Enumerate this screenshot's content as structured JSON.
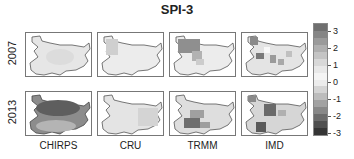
{
  "chart_data": {
    "type": "heatmap",
    "title": "SPI-3",
    "rows": [
      "2007",
      "2013"
    ],
    "columns": [
      "CHIRPS",
      "CRU",
      "TRMM",
      "IMD"
    ],
    "colorbar": {
      "ticks": [
        3,
        2,
        1,
        0,
        -1,
        -2,
        -3
      ],
      "range": [
        -3.3,
        3.3
      ],
      "colors_high_to_low": [
        "#6f6f6f",
        "#858585",
        "#9a9a9a",
        "#afafaf",
        "#c4c4c4",
        "#d8d8d8",
        "#e8e8e8",
        "#f4f4f4",
        "#ececec",
        "#d4d4d4",
        "#bcbcbc",
        "#a2a2a2",
        "#888888",
        "#6c6c6c",
        "#4f4f4f",
        "#353535"
      ]
    },
    "panels": [
      {
        "row": "2007",
        "col": "CHIRPS",
        "description": "uniformly near 0 to slightly positive (~0.5)",
        "mean_spi": 0.5
      },
      {
        "row": "2007",
        "col": "CRU",
        "description": "near 0, northwest slightly positive (~1)",
        "mean_spi": 0.4
      },
      {
        "row": "2007",
        "col": "TRMM",
        "description": "northwest positive (~2), rest near 0",
        "mean_spi": 0.9
      },
      {
        "row": "2007",
        "col": "IMD",
        "description": "patchy positive (~1.5-2.5) scattered, north-west high",
        "mean_spi": 1.0
      },
      {
        "row": "2013",
        "col": "CHIRPS",
        "description": "strongly negative (~-2.5) across north, moderate negative south",
        "mean_spi": -1.8
      },
      {
        "row": "2013",
        "col": "CRU",
        "description": "near 0 to slightly negative (~-0.5)",
        "mean_spi": -0.3
      },
      {
        "row": "2013",
        "col": "TRMM",
        "description": "south-west strongly negative (~-2.5), rest mildly negative",
        "mean_spi": -1.0
      },
      {
        "row": "2013",
        "col": "IMD",
        "description": "patchy negative (~-2 to -3) centre and south-west",
        "mean_spi": -1.1
      }
    ]
  }
}
